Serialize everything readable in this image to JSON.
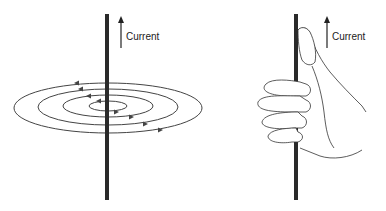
{
  "left_panel": {
    "label": "Current",
    "description": "Straight current-carrying wire with concentric magnetic field loops",
    "field_loops": 4
  },
  "right_panel": {
    "label": "Current",
    "description": "Right-hand grip rule: thumb points along current, fingers curl with field"
  },
  "colors": {
    "wire": "#2a2a2a",
    "lines": "#444444",
    "background": "#ffffff"
  }
}
